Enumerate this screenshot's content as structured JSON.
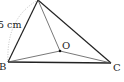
{
  "diagram": {
    "type": "triangle-geometry",
    "points": {
      "A": {
        "x": 38,
        "y": 0,
        "label": ""
      },
      "B": {
        "x": 8,
        "y": 62,
        "label": "B"
      },
      "C": {
        "x": 111,
        "y": 63,
        "label": "C"
      },
      "O": {
        "x": 60,
        "y": 51,
        "label": "O"
      }
    },
    "segments": [
      {
        "from": "A",
        "to": "B",
        "style": "solid-thick"
      },
      {
        "from": "A",
        "to": "C",
        "style": "solid-thick"
      },
      {
        "from": "B",
        "to": "C",
        "style": "solid-thick"
      },
      {
        "from": "A",
        "to": "O",
        "style": "solid-thin"
      },
      {
        "from": "B",
        "to": "O",
        "style": "solid-thin"
      },
      {
        "from": "C",
        "to": "O",
        "style": "solid-thin"
      }
    ],
    "arc": {
      "from": "A",
      "to": "B",
      "style": "dotted"
    },
    "measure_label": "5 cm",
    "colors": {
      "line": "#222222",
      "arc": "#aaaaaa",
      "background": "#ffffff"
    }
  }
}
